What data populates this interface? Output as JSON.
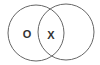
{
  "diagram": {
    "type": "venn",
    "sets": [
      {
        "name": "left-set",
        "cx": 36,
        "cy": 33,
        "r": 28
      },
      {
        "name": "right-set",
        "cx": 66,
        "cy": 32,
        "r": 28
      }
    ],
    "labels": {
      "left_only": "O",
      "intersection": "X"
    },
    "colors": {
      "stroke": "#666666",
      "text": "#333333",
      "background": "#ffffff"
    }
  }
}
